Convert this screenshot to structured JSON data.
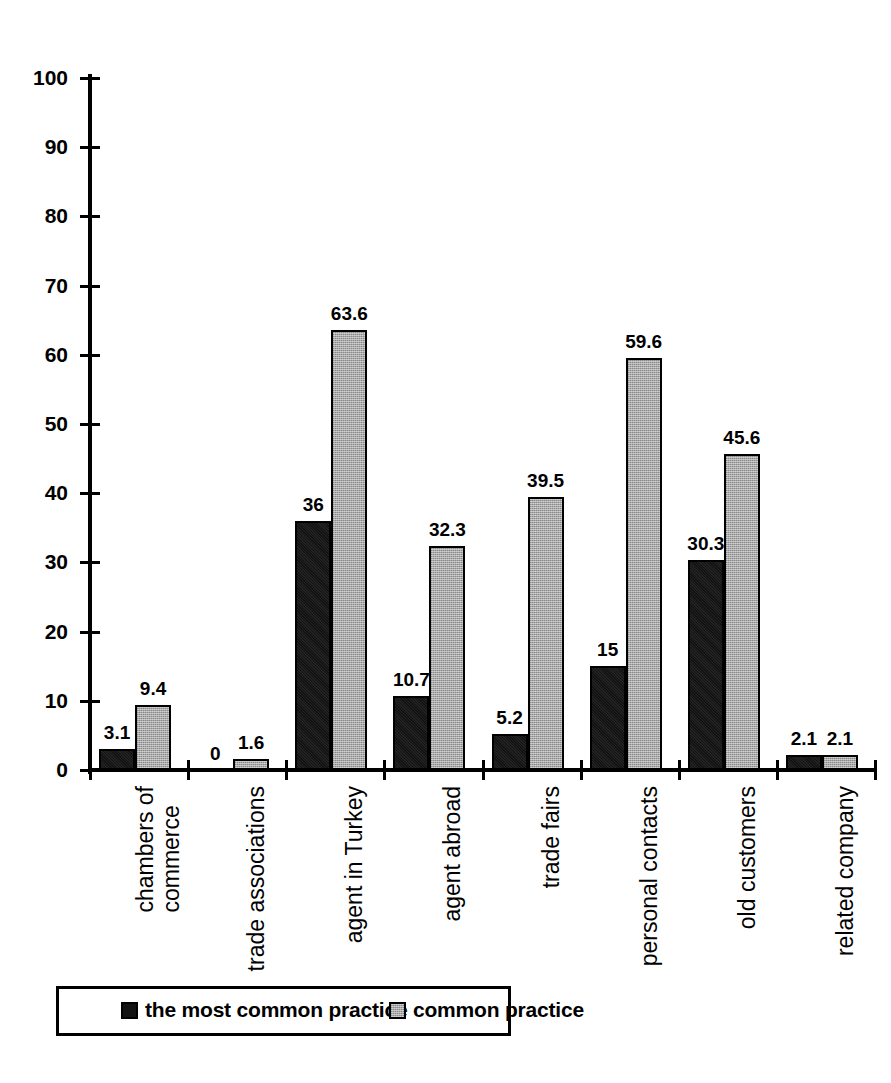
{
  "chart_data": {
    "type": "bar",
    "title": "",
    "subtitle": "",
    "xlabel": "",
    "ylabel": "",
    "ylim": [
      0,
      100
    ],
    "ytick_step": 10,
    "ytick_labels": [
      "0",
      "10",
      "20",
      "30",
      "40",
      "50",
      "60",
      "70",
      "80",
      "90",
      "100"
    ],
    "grid": false,
    "legend_position": "bottom-left",
    "categories": [
      "chambers of commerce",
      "trade associations",
      "agent in Turkey",
      "agent abroad",
      "trade fairs",
      "personal contacts",
      "old customers",
      "related company"
    ],
    "category_lines": [
      [
        "chambers of",
        "commerce"
      ],
      [
        "trade associations"
      ],
      [
        "agent in Turkey"
      ],
      [
        "agent abroad"
      ],
      [
        "trade fairs"
      ],
      [
        "personal contacts"
      ],
      [
        "old customers"
      ],
      [
        "related company"
      ]
    ],
    "series": [
      {
        "name": "the most common practice",
        "color": "#121212",
        "values": [
          3.1,
          0,
          36,
          10.7,
          5.2,
          15,
          30.3,
          2.1
        ],
        "labels": [
          "3.1",
          "0",
          "36",
          "10.7",
          "5.2",
          "15",
          "30.3",
          "2.1"
        ]
      },
      {
        "name": "common practice",
        "color": "#a8a8a8",
        "values": [
          9.4,
          1.6,
          63.6,
          32.3,
          39.5,
          59.6,
          45.6,
          2.1
        ],
        "labels": [
          "9.4",
          "1.6",
          "63.6",
          "32.3",
          "39.5",
          "59.6",
          "45.6",
          "2.1"
        ]
      }
    ]
  },
  "legend": {
    "items": [
      {
        "label": "the most common practice",
        "swatch": "dark-square-icon"
      },
      {
        "label": "common practice",
        "swatch": "gray-square-icon"
      }
    ]
  }
}
